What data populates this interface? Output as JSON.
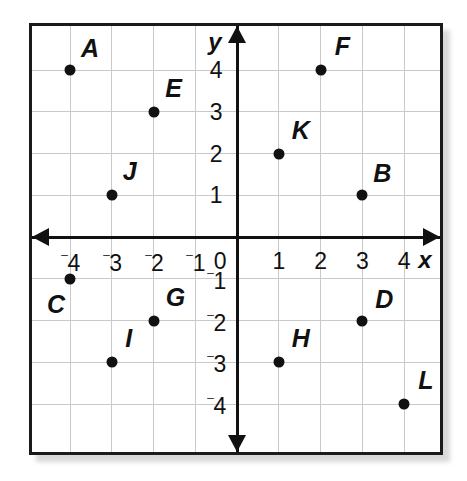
{
  "figure": {
    "background_color": "#ffffff",
    "frame_color": "#1a1a1a",
    "grid_color": "#c9c9c9",
    "axis_color": "#111111",
    "point_color": "#111111"
  },
  "axes": {
    "x_label": "x",
    "y_label": "y",
    "origin_label": "0",
    "x_ticks": [
      {
        "value": -4,
        "sign": "⁻",
        "digit": "4"
      },
      {
        "value": -3,
        "sign": "⁻",
        "digit": "3"
      },
      {
        "value": -2,
        "sign": "⁻",
        "digit": "2"
      },
      {
        "value": -1,
        "sign": "⁻",
        "digit": "1"
      },
      {
        "value": 1,
        "sign": "",
        "digit": "1"
      },
      {
        "value": 2,
        "sign": "",
        "digit": "2"
      },
      {
        "value": 3,
        "sign": "",
        "digit": "3"
      },
      {
        "value": 4,
        "sign": "",
        "digit": "4"
      }
    ],
    "y_ticks": [
      {
        "value": 4,
        "sign": "",
        "digit": "4"
      },
      {
        "value": 3,
        "sign": "",
        "digit": "3"
      },
      {
        "value": 2,
        "sign": "",
        "digit": "2"
      },
      {
        "value": 1,
        "sign": "",
        "digit": "1"
      },
      {
        "value": -1,
        "sign": "⁻",
        "digit": "1"
      },
      {
        "value": -2,
        "sign": "⁻",
        "digit": "2"
      },
      {
        "value": -3,
        "sign": "⁻",
        "digit": "3"
      },
      {
        "value": -4,
        "sign": "⁻",
        "digit": "4"
      }
    ]
  },
  "chart_data": {
    "type": "scatter",
    "title": "",
    "xlabel": "x",
    "ylabel": "y",
    "xlim": [
      -4.9,
      4.9
    ],
    "ylim": [
      -5.1,
      5.1
    ],
    "xticks": [
      -4,
      -3,
      -2,
      -1,
      0,
      1,
      2,
      3,
      4
    ],
    "yticks": [
      -4,
      -3,
      -2,
      -1,
      0,
      1,
      2,
      3,
      4
    ],
    "grid": true,
    "legend": "none",
    "points": [
      {
        "label": "A",
        "x": -4,
        "y": 4,
        "label_dx": 20,
        "label_dy": -22
      },
      {
        "label": "B",
        "x": 3,
        "y": 1,
        "label_dx": 20,
        "label_dy": -22
      },
      {
        "label": "C",
        "x": -4,
        "y": -1,
        "label_dx": -14,
        "label_dy": 25
      },
      {
        "label": "D",
        "x": 3,
        "y": -2,
        "label_dx": 22,
        "label_dy": -22
      },
      {
        "label": "E",
        "x": -2,
        "y": 3,
        "label_dx": 20,
        "label_dy": -24
      },
      {
        "label": "F",
        "x": 2,
        "y": 4,
        "label_dx": 22,
        "label_dy": -24
      },
      {
        "label": "G",
        "x": -2,
        "y": -2,
        "label_dx": 22,
        "label_dy": -24
      },
      {
        "label": "H",
        "x": 1,
        "y": -3,
        "label_dx": 22,
        "label_dy": -24
      },
      {
        "label": "I",
        "x": -3,
        "y": -3,
        "label_dx": 17,
        "label_dy": -24
      },
      {
        "label": "J",
        "x": -3,
        "y": 1,
        "label_dx": 18,
        "label_dy": -24
      },
      {
        "label": "K",
        "x": 1,
        "y": 2,
        "label_dx": 22,
        "label_dy": -24
      },
      {
        "label": "L",
        "x": 4,
        "y": -4,
        "label_dx": 22,
        "label_dy": -24
      }
    ]
  },
  "geometry": {
    "origin_x": 205,
    "origin_y": 211,
    "unit": 41.75,
    "x_label_pos": {
      "x": 393,
      "y": 234
    },
    "y_label_pos": {
      "x": 183,
      "y": 16
    },
    "origin_label_pos": {
      "x": 188,
      "y": 235
    },
    "tick_offset_x": 24,
    "tick_offset_y": 21
  }
}
